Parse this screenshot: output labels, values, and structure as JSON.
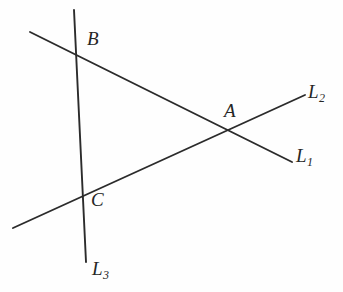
{
  "figure": {
    "background_color": "#fefefe",
    "stroke_color": "#2b2b2b",
    "width": 343,
    "height": 292
  },
  "lines": [
    {
      "id": "L1",
      "label": "L",
      "subscript": "1",
      "label_x": 296,
      "label_y": 146,
      "x1": 30,
      "y1": 32,
      "x2": 292,
      "y2": 162
    },
    {
      "id": "L2",
      "label": "L",
      "subscript": "2",
      "label_x": 308,
      "label_y": 82,
      "x1": 13,
      "y1": 228,
      "x2": 305,
      "y2": 95
    },
    {
      "id": "L3",
      "label": "L",
      "subscript": "3",
      "label_x": 92,
      "label_y": 259,
      "x1": 74,
      "y1": 10,
      "x2": 86,
      "y2": 262
    }
  ],
  "points": [
    {
      "id": "A",
      "label": "A",
      "x": 228,
      "y": 128,
      "label_x": 224,
      "label_y": 101,
      "intersection_of": "L1 and L2"
    },
    {
      "id": "B",
      "label": "B",
      "x": 72,
      "y": 53,
      "label_x": 87,
      "label_y": 29,
      "intersection_of": "L1 and L3"
    },
    {
      "id": "C",
      "label": "C",
      "x": 80,
      "y": 197,
      "label_x": 91,
      "label_y": 190,
      "intersection_of": "L2 and L3"
    }
  ]
}
